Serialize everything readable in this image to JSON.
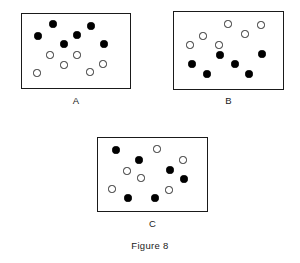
{
  "figure": {
    "caption": "Figure 8",
    "caption_x": 0,
    "caption_y": 240,
    "width": 300,
    "height": 263,
    "dot_diameter": 7.2,
    "colors": {
      "filled": "#000000",
      "open_fill": "#ffffff",
      "outline": "#2b2b2b",
      "border": "#1a1a1a",
      "background": "#ffffff",
      "text": "#1a1a1a"
    }
  },
  "chart_data": {
    "type": "scatter",
    "title": "Figure 8",
    "xlabel": "",
    "ylabel": "",
    "grid": false,
    "legend": "none",
    "categories": [
      "filled",
      "open"
    ],
    "panels": [
      {
        "label": "A",
        "box": {
          "x": 21,
          "y": 13,
          "width": 110,
          "height": 76
        },
        "label_x": 21,
        "label_y": 95,
        "counts": {
          "filled": 6,
          "open": 6
        },
        "arrangement": "segregated-filled-top",
        "points": [
          {
            "x": 53,
            "y": 24,
            "type": "filled"
          },
          {
            "x": 91,
            "y": 26,
            "type": "filled"
          },
          {
            "x": 38,
            "y": 36,
            "type": "filled"
          },
          {
            "x": 77,
            "y": 35,
            "type": "filled"
          },
          {
            "x": 64,
            "y": 44,
            "type": "filled"
          },
          {
            "x": 104,
            "y": 44,
            "type": "filled"
          },
          {
            "x": 50,
            "y": 55,
            "type": "open"
          },
          {
            "x": 77,
            "y": 55,
            "type": "open"
          },
          {
            "x": 64,
            "y": 65,
            "type": "open"
          },
          {
            "x": 103,
            "y": 64,
            "type": "open"
          },
          {
            "x": 37,
            "y": 73,
            "type": "open"
          },
          {
            "x": 90,
            "y": 72,
            "type": "open"
          }
        ]
      },
      {
        "label": "B",
        "box": {
          "x": 173,
          "y": 11,
          "width": 111,
          "height": 79
        },
        "label_x": 173,
        "label_y": 95,
        "counts": {
          "filled": 6,
          "open": 6
        },
        "arrangement": "segregated-open-top",
        "points": [
          {
            "x": 228,
            "y": 24,
            "type": "open"
          },
          {
            "x": 261,
            "y": 25,
            "type": "open"
          },
          {
            "x": 203,
            "y": 36,
            "type": "open"
          },
          {
            "x": 245,
            "y": 34,
            "type": "open"
          },
          {
            "x": 190,
            "y": 45,
            "type": "open"
          },
          {
            "x": 219,
            "y": 45,
            "type": "open"
          },
          {
            "x": 220,
            "y": 55,
            "type": "filled"
          },
          {
            "x": 262,
            "y": 54,
            "type": "filled"
          },
          {
            "x": 192,
            "y": 64,
            "type": "filled"
          },
          {
            "x": 235,
            "y": 64,
            "type": "filled"
          },
          {
            "x": 207,
            "y": 74,
            "type": "filled"
          },
          {
            "x": 249,
            "y": 74,
            "type": "filled"
          }
        ]
      },
      {
        "label": "C",
        "box": {
          "x": 97,
          "y": 137,
          "width": 111,
          "height": 75
        },
        "label_x": 97,
        "label_y": 218,
        "counts": {
          "filled": 6,
          "open": 6
        },
        "arrangement": "intermixed",
        "points": [
          {
            "x": 116,
            "y": 150,
            "type": "filled"
          },
          {
            "x": 157,
            "y": 149,
            "type": "open"
          },
          {
            "x": 139,
            "y": 160,
            "type": "filled"
          },
          {
            "x": 183,
            "y": 160,
            "type": "open"
          },
          {
            "x": 127,
            "y": 171,
            "type": "open"
          },
          {
            "x": 170,
            "y": 170,
            "type": "filled"
          },
          {
            "x": 141,
            "y": 178,
            "type": "open"
          },
          {
            "x": 184,
            "y": 179,
            "type": "filled"
          },
          {
            "x": 112,
            "y": 189,
            "type": "open"
          },
          {
            "x": 169,
            "y": 190,
            "type": "open"
          },
          {
            "x": 128,
            "y": 198,
            "type": "filled"
          },
          {
            "x": 155,
            "y": 198,
            "type": "filled"
          }
        ]
      }
    ]
  }
}
